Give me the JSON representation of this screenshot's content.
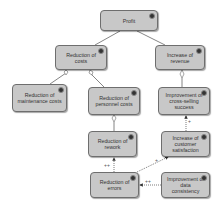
{
  "diagram": {
    "type": "goal-tree",
    "nodes": [
      {
        "id": "profit",
        "label": "Profit",
        "x": 100,
        "y": 10,
        "w": 58,
        "h": 21
      },
      {
        "id": "reduction-of-costs",
        "label": "Reduction of costs",
        "x": 55,
        "y": 45,
        "w": 52,
        "h": 25
      },
      {
        "id": "increase-of-revenue",
        "label": "Increase of revenue",
        "x": 155,
        "y": 45,
        "w": 50,
        "h": 25
      },
      {
        "id": "reduction-of-maintenance-costs",
        "label": "Reduction of maintenance costs",
        "x": 12,
        "y": 84,
        "w": 55,
        "h": 28
      },
      {
        "id": "reduction-of-personnel-costs",
        "label": "Reduction of personnel costs",
        "x": 88,
        "y": 87,
        "w": 52,
        "h": 28
      },
      {
        "id": "improvement-of-cross-selling-success",
        "label": "Improvement of cross-selling success",
        "x": 158,
        "y": 87,
        "w": 52,
        "h": 28
      },
      {
        "id": "reduction-of-rework",
        "label": "Reduction of rework",
        "x": 88,
        "y": 131,
        "w": 49,
        "h": 26
      },
      {
        "id": "increase-of-customer-satisfaction",
        "label": "Increase of customer satisfaction",
        "x": 161,
        "y": 131,
        "w": 49,
        "h": 26
      },
      {
        "id": "reduction-of-errors",
        "label": "Reduction of errors",
        "x": 90,
        "y": 172,
        "w": 49,
        "h": 26
      },
      {
        "id": "improvement-of-data-consistency",
        "label": "Improvement of data consistency",
        "x": 161,
        "y": 172,
        "w": 49,
        "h": 26
      }
    ],
    "edge_labels": [
      {
        "text": "++",
        "x": 104,
        "y": 162
      },
      {
        "text": "+",
        "x": 155,
        "y": 157
      },
      {
        "text": "++",
        "x": 145,
        "y": 178
      },
      {
        "text": "+",
        "x": 188,
        "y": 118
      }
    ]
  }
}
